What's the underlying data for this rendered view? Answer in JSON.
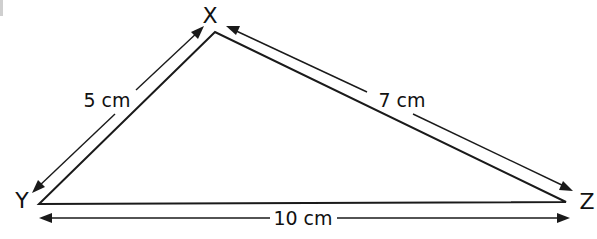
{
  "figure": {
    "type": "triangle",
    "vertices": [
      {
        "id": "X",
        "label": "X",
        "x": 215,
        "y": 32
      },
      {
        "id": "Y",
        "label": "Y",
        "x": 39,
        "y": 204
      },
      {
        "id": "Z",
        "label": "Z",
        "x": 566,
        "y": 202
      }
    ],
    "sides": [
      {
        "id": "XY",
        "from": "Y",
        "to": "X",
        "length_label": "5 cm"
      },
      {
        "id": "XZ",
        "from": "X",
        "to": "Z",
        "length_label": "7 cm"
      },
      {
        "id": "YZ",
        "from": "Y",
        "to": "Z",
        "length_label": "10 cm"
      }
    ]
  },
  "labels": {
    "vertex_x": "X",
    "vertex_y": "Y",
    "vertex_z": "Z",
    "side_xy": "5 cm",
    "side_xz": "7 cm",
    "side_yz": "10 cm"
  },
  "colors": {
    "stroke": "#1a1a1a",
    "background": "#ffffff"
  }
}
